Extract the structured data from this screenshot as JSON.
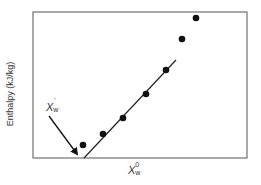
{
  "chart_data": {
    "type": "scatter",
    "title": "",
    "xlabel": "X_w^0",
    "xlabel_parts": {
      "base": "X",
      "sub": "w",
      "sup": "0"
    },
    "ylabel": "Enthalpy (kJ/kg)",
    "grid": false,
    "legend": null,
    "axis_ticks": "none",
    "points": [
      {
        "x": 83,
        "y": 145
      },
      {
        "x": 103,
        "y": 134
      },
      {
        "x": 123,
        "y": 118
      },
      {
        "x": 146,
        "y": 94
      },
      {
        "x": 166,
        "y": 70
      },
      {
        "x": 182,
        "y": 39
      },
      {
        "x": 196,
        "y": 18
      }
    ],
    "points_note": "pixel coordinates (no numeric axis scales shown)",
    "fit_line": {
      "x1": 84,
      "y1": 158,
      "x2": 176,
      "y2": 60,
      "note": "linear fit through middle points extrapolated to x-axis"
    },
    "annotations": [
      {
        "text": "X_w'",
        "parts": {
          "base": "X",
          "sub": "w",
          "sup": "'"
        },
        "arrow_from": [
          49,
          116
        ],
        "arrow_to": [
          77,
          154
        ]
      }
    ],
    "frame": {
      "left": 33,
      "top": 12,
      "right": 247,
      "bottom": 158
    }
  },
  "colors": {
    "frame": "#707070",
    "points": "#111111",
    "line": "#222222",
    "text": "#333333"
  }
}
